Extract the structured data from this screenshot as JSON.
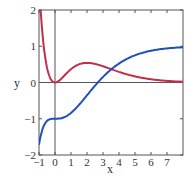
{
  "chart_data": {
    "type": "line",
    "title": "",
    "xlabel": "x",
    "ylabel": "y",
    "xlim": [
      -1,
      8
    ],
    "ylim": [
      -2,
      2
    ],
    "xticks": [
      "-1",
      "0",
      "1",
      "2",
      "3",
      "4",
      "5",
      "6",
      "7"
    ],
    "yticks": [
      "-2",
      "-1",
      "0",
      "1",
      "2"
    ],
    "grid": false,
    "series": [
      {
        "name": "f(x) = x^2 e^-x",
        "color": "#c0304a",
        "x": [
          -1,
          -0.5,
          0,
          0.5,
          1,
          1.5,
          2,
          2.5,
          3,
          4,
          5,
          6,
          7,
          8
        ],
        "values": [
          2.72,
          0.41,
          0,
          0.15,
          0.37,
          0.5,
          0.54,
          0.51,
          0.45,
          0.29,
          0.17,
          0.09,
          0.04,
          0.02
        ]
      },
      {
        "name": "F(x) = 1 - (x^2+2x+2) e^-x",
        "color": "#1f4fb8",
        "x": [
          -1,
          -0.5,
          0,
          0.5,
          1,
          1.5,
          2,
          2.5,
          3,
          4,
          5,
          6,
          7,
          8
        ],
        "values": [
          -1.72,
          -1.06,
          -1,
          -0.96,
          -0.84,
          -0.62,
          -0.35,
          -0.09,
          0.15,
          0.52,
          0.75,
          0.88,
          0.94,
          0.97
        ]
      }
    ]
  },
  "labels": {
    "x": "x",
    "y": "y"
  }
}
